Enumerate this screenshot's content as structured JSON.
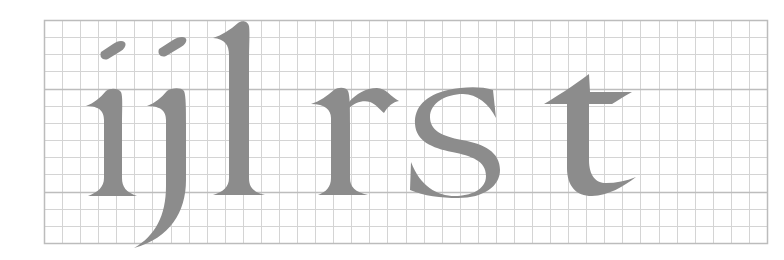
{
  "diagram": {
    "type": "lettering-guide-grid",
    "letters": [
      "i",
      "j",
      "l",
      "r",
      "s",
      "t"
    ],
    "caption_text": "ijlrst",
    "grid": {
      "columns": 40,
      "rows": 13,
      "guide_lines": [
        "x-height line",
        "baseline"
      ]
    },
    "colors": {
      "background": "#ffffff",
      "grid_line": "#d4d4d4",
      "guide_line": "#bdbdbd",
      "border": "#bcbcbc",
      "glyph": "#8c8c8c"
    }
  }
}
